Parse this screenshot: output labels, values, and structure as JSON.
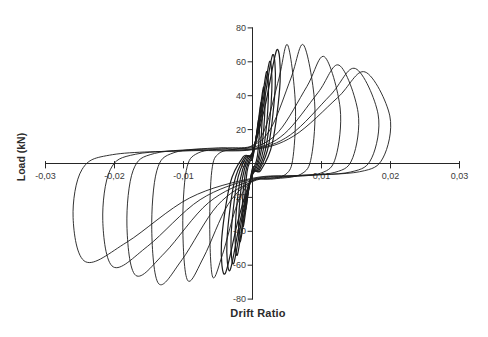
{
  "chart_data": {
    "type": "line",
    "title": "",
    "xlabel": "Drift Ratio",
    "ylabel": "Load (kN)",
    "xlim": [
      -0.03,
      0.03
    ],
    "ylim": [
      -80,
      80
    ],
    "grid": false,
    "legend": "none",
    "line_color": "#1c1c1c",
    "axis_color": "#262626",
    "series_description": "Cyclic load-drift hysteresis loops (single black series, pinched loops with strength degradation)",
    "x_ticks": [
      {
        "value": -0.03,
        "label": "-0,03"
      },
      {
        "value": -0.02,
        "label": "-0,02"
      },
      {
        "value": -0.01,
        "label": "-0,01"
      },
      {
        "value": 0.01,
        "label": "0,01"
      },
      {
        "value": 0.02,
        "label": "0,02"
      },
      {
        "value": 0.03,
        "label": "0,03"
      }
    ],
    "y_ticks": [
      {
        "value": 80,
        "label": "80"
      },
      {
        "value": 60,
        "label": "60"
      },
      {
        "value": 40,
        "label": "40"
      },
      {
        "value": 20,
        "label": "20"
      },
      {
        "value": 0,
        "label": "0"
      },
      {
        "value": -20,
        "label": "-20"
      },
      {
        "value": -40,
        "label": "-40"
      },
      {
        "value": -60,
        "label": "-60"
      },
      {
        "value": -80,
        "label": "-80"
      }
    ],
    "cycles": [
      {
        "size": "small",
        "pos_drift": 0.001,
        "pos_peak_kN": 26,
        "neg_drift": 0.0011,
        "neg_peak_kN": -27
      },
      {
        "size": "small",
        "pos_drift": 0.0014,
        "pos_peak_kN": 36,
        "neg_drift": 0.0015,
        "neg_peak_kN": -37
      },
      {
        "size": "small",
        "pos_drift": 0.0018,
        "pos_peak_kN": 45,
        "neg_drift": 0.002,
        "neg_peak_kN": -46
      },
      {
        "size": "small",
        "pos_drift": 0.0023,
        "pos_peak_kN": 54,
        "neg_drift": 0.0025,
        "neg_peak_kN": -54
      },
      {
        "size": "small",
        "pos_drift": 0.0028,
        "pos_peak_kN": 60,
        "neg_drift": 0.0031,
        "neg_peak_kN": -59
      },
      {
        "size": "small",
        "pos_drift": 0.0033,
        "pos_peak_kN": 64,
        "neg_drift": 0.0037,
        "neg_peak_kN": -63
      },
      {
        "size": "small",
        "pos_drift": 0.004,
        "pos_peak_kN": 67,
        "neg_drift": 0.0045,
        "neg_peak_kN": -65
      },
      {
        "size": "large",
        "pos_drift": 0.0062,
        "pos_peak_kN": 70,
        "neg_drift": 0.0062,
        "neg_peak_kN": -67
      },
      {
        "size": "large",
        "pos_drift": 0.009,
        "pos_peak_kN": 70,
        "neg_drift": 0.0101,
        "neg_peak_kN": -69
      },
      {
        "size": "large",
        "pos_drift": 0.0127,
        "pos_peak_kN": 63,
        "neg_drift": 0.0146,
        "neg_peak_kN": -71
      },
      {
        "size": "large",
        "pos_drift": 0.0153,
        "pos_peak_kN": 58,
        "neg_drift": 0.0182,
        "neg_peak_kN": -66
      },
      {
        "size": "large",
        "pos_drift": 0.0182,
        "pos_peak_kN": 56,
        "neg_drift": 0.0217,
        "neg_peak_kN": -61
      },
      {
        "size": "large",
        "pos_drift": 0.0199,
        "pos_peak_kN": 54,
        "neg_drift": 0.026,
        "neg_peak_kN": -58
      }
    ]
  }
}
